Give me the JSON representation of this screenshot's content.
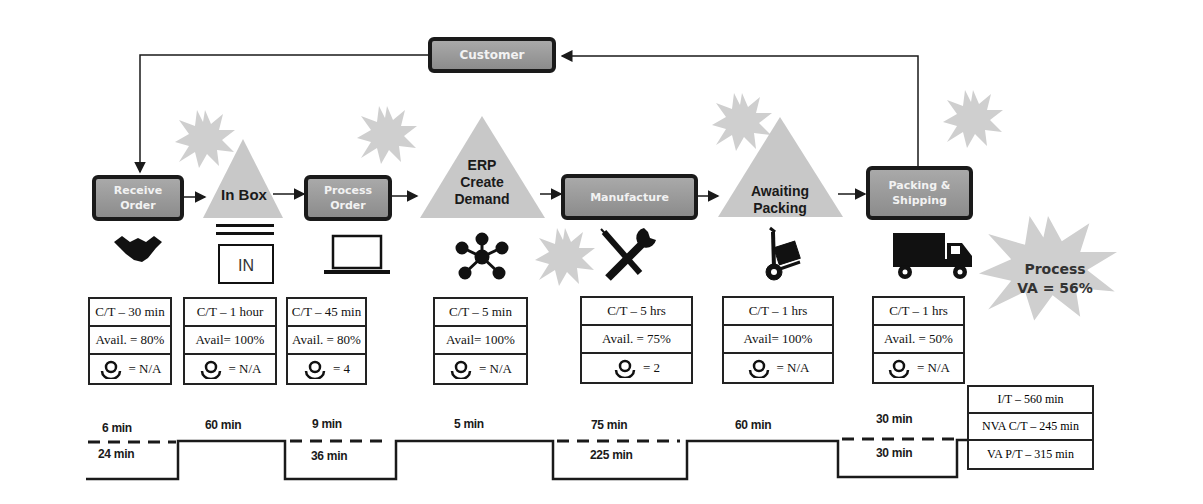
{
  "customer": {
    "label": "Customer"
  },
  "steps": [
    {
      "type": "process",
      "label_line1": "Receive",
      "label_line2": "Order",
      "icon": "handshake-icon",
      "ct": "C/T – 30 min",
      "avail": "Avail. = 80%",
      "operators": "= N/A"
    },
    {
      "type": "inventory",
      "label_line1": "In Box",
      "label_line2": "",
      "icon": "inbox-tray-icon",
      "icon_text": "IN",
      "ct": "C/T – 1 hour",
      "avail": "Avail= 100%",
      "operators": "= N/A"
    },
    {
      "type": "process",
      "label_line1": "Process",
      "label_line2": "Order",
      "icon": "laptop-icon",
      "ct": "C/T – 45 min",
      "avail": "Avail. = 80%",
      "operators": "= 4"
    },
    {
      "type": "inventory",
      "label_line1": "ERP",
      "label_line2": "Create",
      "label_line3": "Demand",
      "icon": "network-hub-icon",
      "ct": "C/T – 5 min",
      "avail": "Avail= 100%",
      "operators": "= N/A"
    },
    {
      "type": "process",
      "label_line1": "Manufacture",
      "label_line2": "",
      "icon": "tools-icon",
      "ct": "C/T – 5 hrs",
      "avail": "Avail. = 75%",
      "operators": "= 2"
    },
    {
      "type": "inventory",
      "label_line1": "Awaiting",
      "label_line2": "Packing",
      "icon": "hand-truck-icon",
      "ct": "C/T – 1 hrs",
      "avail": "Avail= 100%",
      "operators": "= N/A"
    },
    {
      "type": "process",
      "label_line1": "Packing &",
      "label_line2": "Shipping",
      "icon": "dump-truck-icon",
      "ct": "C/T – 1 hrs",
      "avail": "Avail. = 50%",
      "operators": "= N/A"
    }
  ],
  "timeline": {
    "value_added_top": [
      "6 min",
      "60 min",
      "9 min",
      "5 min",
      "75 min",
      "60 min",
      "30 min"
    ],
    "non_value_added_bottom": [
      "24 min",
      "36 min",
      "225 min",
      "30 min"
    ]
  },
  "summary": {
    "lead_time": "I/T – 560 min",
    "nva_cycle_time": "NVA C/T – 245 min",
    "va_process_time": "VA P/T – 315 min"
  },
  "process_va": {
    "line1": "Process",
    "line2": "VA = 56%"
  },
  "colors": {
    "process_fill": "#9a9a9a",
    "burst_fill": "#cfcfcf",
    "triangle_fill": "#c8c8c8",
    "line": "#1a1a1a"
  }
}
